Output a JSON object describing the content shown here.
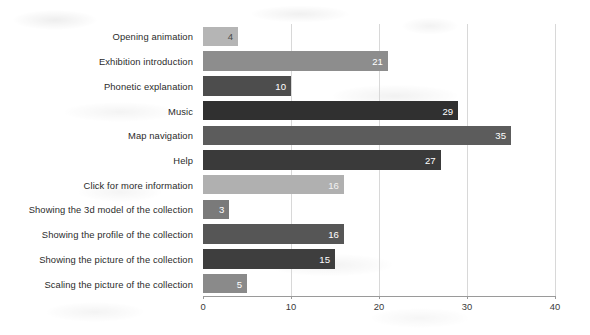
{
  "chart_data": {
    "type": "bar",
    "orientation": "horizontal",
    "title": "",
    "subtitle": "",
    "xlabel": "",
    "ylabel": "",
    "xlim": [
      0,
      40
    ],
    "xticks": [
      0,
      10,
      20,
      30,
      40
    ],
    "xtick_labels": [
      "0",
      "10",
      "20",
      "30",
      "40"
    ],
    "grid": true,
    "grid_axis": "x",
    "legend": false,
    "show_value_labels": true,
    "categories": [
      "Opening animation",
      "Exhibition introduction",
      "Phonetic explanation",
      "Music",
      "Map navigation",
      "Help",
      "Click for more information",
      "Showing the 3d model of the collection",
      "Showing the profile of the collection",
      "Showing the picture of the collection",
      "Scaling the picture of the collection"
    ],
    "values": [
      4,
      21,
      10,
      29,
      35,
      27,
      16,
      3,
      16,
      15,
      5
    ],
    "bar_colors": [
      "#b5b5b5",
      "#8d8d8d",
      "#4d4d4d",
      "#303030",
      "#5c5c5c",
      "#3a3a3a",
      "#b0b0b0",
      "#7a7a7a",
      "#565656",
      "#3e3e3e",
      "#8a8a8a"
    ],
    "value_label_colors": [
      "#4a4a4a",
      "#ffffff",
      "#ffffff",
      "#ffffff",
      "#ffffff",
      "#ffffff",
      "#f2f2f2",
      "#ffffff",
      "#ffffff",
      "#ffffff",
      "#ffffff"
    ]
  },
  "figure": {
    "background_color": "#ffffff",
    "gridline_color": "#d8d8d8",
    "axis_color": "#9a9a9a"
  }
}
